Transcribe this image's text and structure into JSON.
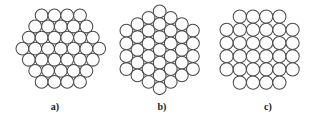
{
  "figure": {
    "kind": "sphere-packing-diagram",
    "background_color": "#ffffff",
    "circle_fill_color": "#fdfdfd",
    "circle_stroke_color": "#4a4a4a",
    "label_color": "#1a1a1a",
    "panel_count": 3
  },
  "panels": [
    {
      "id": "panel-a",
      "label": "a)",
      "packing": "hexagonal-close-packed-rows",
      "orientation": "flat-top",
      "row_counts": [
        4,
        5,
        6,
        7,
        6,
        5,
        4
      ],
      "circle_count": 37,
      "radius": 6.4,
      "spacing": 12.8,
      "origin_x": 16,
      "origin_y": 9,
      "panel_left": 0,
      "panel_width": 110,
      "label_top": 101
    },
    {
      "id": "panel-b",
      "label": "b)",
      "packing": "hexagonal-close-packed-columns",
      "orientation": "pointy-top",
      "column_counts": [
        4,
        5,
        6,
        7,
        6,
        5,
        4
      ],
      "circle_count": 37,
      "radius": 6.4,
      "spacing": 12.8,
      "origin_x": 10,
      "origin_y": 5,
      "panel_left": 110,
      "panel_width": 104,
      "label_top": 101
    },
    {
      "id": "panel-c",
      "label": "c)",
      "packing": "simple-cubic-square-grid",
      "orientation": "square",
      "row_counts": [
        4,
        6,
        6,
        6,
        6,
        4
      ],
      "circle_count": 32,
      "radius": 6.6,
      "spacing": 13.2,
      "origin_x": 6,
      "origin_y": 10,
      "panel_left": 214,
      "panel_width": 108,
      "label_top": 101
    }
  ]
}
